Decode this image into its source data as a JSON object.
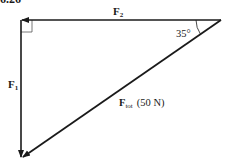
{
  "figure_label": "6.26",
  "vectors": {
    "f2": {
      "name": "F",
      "sub": "2"
    },
    "f1": {
      "name": "F",
      "sub": "1"
    },
    "ftot": {
      "name": "F",
      "sub": "tot",
      "magnitude": "(50 N)"
    }
  },
  "angle_label": "35°",
  "colors": {
    "ink": "#1a1a1a",
    "right_angle": "#555555"
  }
}
